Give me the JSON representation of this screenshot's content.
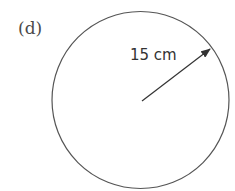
{
  "part_label": "(d)",
  "shape": {
    "type": "circle",
    "center": {
      "x": 140.5,
      "y": 100
    },
    "radius_px": 88.5,
    "stroke_color": "#555555"
  },
  "radius_annotation": {
    "text": "15 cm",
    "value": 15,
    "unit": "cm",
    "arrow_from": {
      "x": 142,
      "y": 101
    },
    "arrow_to": {
      "x": 210,
      "y": 49
    },
    "arrow_color": "#333333"
  }
}
